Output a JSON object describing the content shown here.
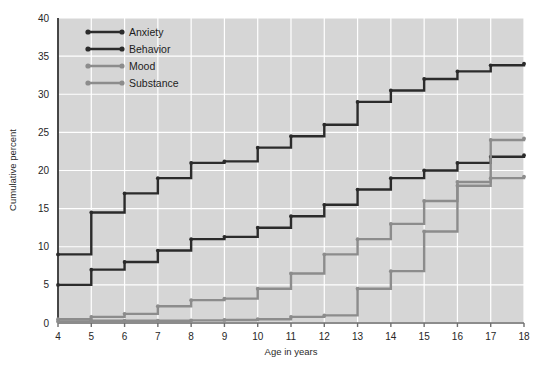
{
  "chart_data": {
    "type": "line",
    "title": "",
    "xlabel": "Age in years",
    "ylabel": "Cumulative percent",
    "xlim": [
      4,
      18
    ],
    "ylim": [
      0,
      40
    ],
    "xticks": [
      4,
      5,
      6,
      7,
      8,
      9,
      10,
      11,
      12,
      13,
      14,
      15,
      16,
      17,
      18
    ],
    "yticks": [
      0,
      5,
      10,
      15,
      20,
      25,
      30,
      35,
      40
    ],
    "grid": true,
    "step_style": "post",
    "legend_position": "top-left",
    "x": [
      4,
      5,
      6,
      7,
      8,
      9,
      10,
      11,
      12,
      13,
      14,
      15,
      16,
      17,
      18
    ],
    "series": [
      {
        "name": "Anxiety",
        "color": "#2b2b2b",
        "values": [
          9,
          14.5,
          17,
          19,
          21,
          21.2,
          23,
          24.5,
          26,
          29,
          30.5,
          32,
          33,
          33.8,
          34
        ]
      },
      {
        "name": "Behavior",
        "color": "#2b2b2b",
        "values": [
          5,
          7,
          8,
          9.5,
          11,
          11.3,
          12.5,
          14,
          15.5,
          17.5,
          19,
          20,
          21,
          21.8,
          22
        ]
      },
      {
        "name": "Mood",
        "color": "#8c8c8c",
        "values": [
          0.5,
          0.8,
          1.2,
          2.2,
          3,
          3.2,
          4.5,
          6.5,
          9,
          11,
          13,
          16,
          18.5,
          24,
          24.2
        ]
      },
      {
        "name": "Substance",
        "color": "#8c8c8c",
        "values": [
          0.2,
          0.3,
          0.3,
          0.3,
          0.35,
          0.4,
          0.5,
          0.8,
          1,
          4.5,
          6.8,
          12,
          18,
          19,
          19.2
        ]
      }
    ]
  },
  "legend": {
    "items": [
      {
        "label": "Anxiety",
        "color": "#2b2b2b"
      },
      {
        "label": "Behavior",
        "color": "#2b2b2b"
      },
      {
        "label": "Mood",
        "color": "#8c8c8c"
      },
      {
        "label": "Substance",
        "color": "#8c8c8c"
      }
    ]
  },
  "axes": {
    "x_title": "Age in years",
    "y_title": "Cumulative percent",
    "x_tick_labels": [
      "4",
      "5",
      "6",
      "7",
      "8",
      "9",
      "10",
      "11",
      "12",
      "13",
      "14",
      "15",
      "16",
      "17",
      "18"
    ],
    "y_tick_labels": [
      "0",
      "5",
      "10",
      "15",
      "20",
      "25",
      "30",
      "35",
      "40"
    ]
  },
  "style": {
    "plot_background": "#d6d6d6",
    "gridline_color": "#ffffff",
    "page_background": "#ffffff",
    "dark_series_color": "#2b2b2b",
    "light_series_color": "#8c8c8c"
  }
}
